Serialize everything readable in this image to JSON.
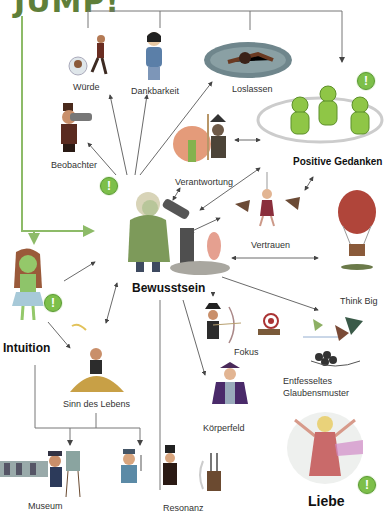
{
  "title": "JUMP!",
  "colors": {
    "title": "#5f7f3a",
    "green_line": "#8dbb68",
    "arrow": "#444444",
    "badge": "#7dbf4a"
  },
  "badge_symbol": "!",
  "nodes": {
    "wuerde": "Würde",
    "dankbarkeit": "Dankbarkeit",
    "loslassen": "Loslassen",
    "beobachter": "Beobachter",
    "verantwortung": "Verantwortung",
    "positive_gedanken": "Positive Gedanken",
    "vertrauen": "Vertrauen",
    "bewusstsein": "Bewusstsein",
    "think_big": "Think Big",
    "intuition": "Intuition",
    "fokus": "Fokus",
    "entfesseltes_glaubensmuster_1": "Entfesseltes",
    "entfesseltes_glaubensmuster_2": "Glaubensmuster",
    "sinn_des_lebens": "Sinn des Lebens",
    "koerperfeld": "Körperfeld",
    "museum": "Museum",
    "resonanz": "Resonanz",
    "liebe": "Liebe"
  }
}
